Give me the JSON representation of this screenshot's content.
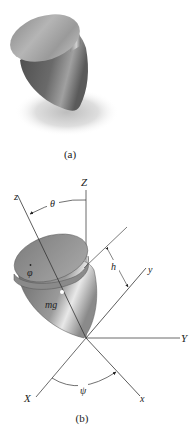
{
  "figure_a": {
    "caption": "(a)"
  },
  "figure_b": {
    "caption": "(b)",
    "labels": {
      "Z": "Z",
      "z": "z",
      "theta": "θ",
      "phi_dot": "φ",
      "h": "h",
      "y": "y",
      "mg": "mg",
      "Y": "Y",
      "X": "X",
      "psi": "ψ",
      "x": "x"
    }
  },
  "colors": {
    "body_dark": "#6e6e6e",
    "body_light": "#b8b8b8",
    "cap_top": "#a8a8a8",
    "line": "#333333",
    "shadow": "#d9d9d9"
  }
}
